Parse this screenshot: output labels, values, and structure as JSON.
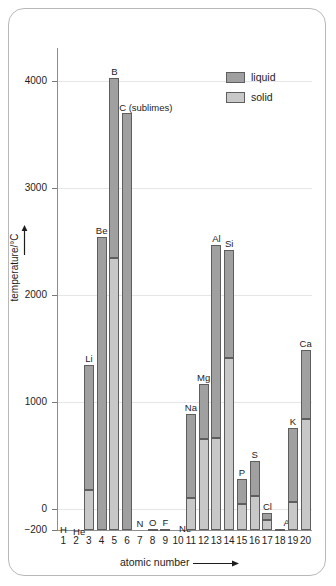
{
  "chart_data": {
    "type": "bar",
    "title": "",
    "xlabel": "atomic number",
    "ylabel": "temperature/°C",
    "ylim": [
      -280,
      4250
    ],
    "yticks": [
      -200,
      0,
      1000,
      2000,
      3000,
      4000
    ],
    "ytick_labels": [
      "-200",
      "0",
      "1000",
      "2000",
      "3000",
      "4000"
    ],
    "grid": true,
    "legend_position": "top-right",
    "legend": [
      {
        "name": "liquid",
        "color": "#a0a0a0"
      },
      {
        "name": "solid",
        "color": "#c8c8c8"
      }
    ],
    "stacked": true,
    "note": "Each bar spans melting point (solid/liquid boundary) to boiling point (bar top). Solid segment = lower portion, liquid segment = upper portion.",
    "categories": [
      "1",
      "2",
      "3",
      "4",
      "5",
      "6",
      "7",
      "8",
      "9",
      "10",
      "11",
      "12",
      "13",
      "14",
      "15",
      "16",
      "17",
      "18",
      "19",
      "20"
    ],
    "bars": [
      {
        "atomic_number": 1,
        "symbol": "H",
        "melting_point": -259,
        "boiling_point": -253
      },
      {
        "atomic_number": 2,
        "symbol": "He",
        "melting_point": -272,
        "boiling_point": -269
      },
      {
        "atomic_number": 3,
        "symbol": "Li",
        "melting_point": 181,
        "boiling_point": 1342
      },
      {
        "atomic_number": 4,
        "symbol": "Be",
        "melting_point": -280,
        "boiling_point": 2540
      },
      {
        "atomic_number": 5,
        "symbol": "B",
        "melting_point": 2350,
        "boiling_point": 4030
      },
      {
        "atomic_number": 6,
        "symbol": "C (sublimes)",
        "melting_point": -280,
        "boiling_point": 3700
      },
      {
        "atomic_number": 7,
        "symbol": "N",
        "melting_point": -210,
        "boiling_point": -196
      },
      {
        "atomic_number": 8,
        "symbol": "O",
        "melting_point": -219,
        "boiling_point": -183
      },
      {
        "atomic_number": 9,
        "symbol": "F",
        "melting_point": -220,
        "boiling_point": -188
      },
      {
        "atomic_number": 10,
        "symbol": "Ne",
        "melting_point": -249,
        "boiling_point": -246
      },
      {
        "atomic_number": 11,
        "symbol": "Na",
        "melting_point": 98,
        "boiling_point": 890
      },
      {
        "atomic_number": 12,
        "symbol": "Mg",
        "melting_point": 650,
        "boiling_point": 1170
      },
      {
        "atomic_number": 13,
        "symbol": "Al",
        "melting_point": 660,
        "boiling_point": 2470
      },
      {
        "atomic_number": 14,
        "symbol": "Si",
        "melting_point": 1410,
        "boiling_point": 2420
      },
      {
        "atomic_number": 15,
        "symbol": "P",
        "melting_point": 44,
        "boiling_point": 280
      },
      {
        "atomic_number": 16,
        "symbol": "S",
        "melting_point": 119,
        "boiling_point": 445
      },
      {
        "atomic_number": 17,
        "symbol": "Cl",
        "melting_point": -101,
        "boiling_point": -34
      },
      {
        "atomic_number": 18,
        "symbol": "Ar",
        "melting_point": -189,
        "boiling_point": -186
      },
      {
        "atomic_number": 19,
        "symbol": "K",
        "melting_point": 63,
        "boiling_point": 760
      },
      {
        "atomic_number": 20,
        "symbol": "Ca",
        "melting_point": 840,
        "boiling_point": 1490
      }
    ]
  }
}
